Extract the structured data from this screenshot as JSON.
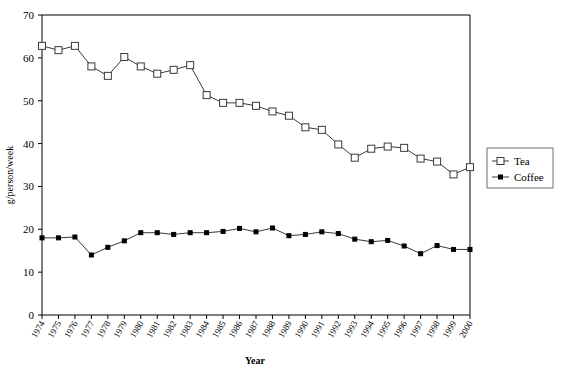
{
  "chart_data": {
    "type": "line",
    "title": "",
    "xlabel": "Year",
    "ylabel": "g/person/week",
    "xlim": [
      1974,
      2000
    ],
    "ylim": [
      0,
      70
    ],
    "ytick_step": 10,
    "yticks": [
      0,
      10,
      20,
      30,
      40,
      50,
      60,
      70
    ],
    "grid": false,
    "legend_position": "right",
    "categories": [
      "1974",
      "1975",
      "1976",
      "1977",
      "1978",
      "1979",
      "1980",
      "1981",
      "1982",
      "1983",
      "1984",
      "1985",
      "1986",
      "1987",
      "1988",
      "1989",
      "1990",
      "1991",
      "1992",
      "1993",
      "1994",
      "1995",
      "1996",
      "1997",
      "1998",
      "1999",
      "2000"
    ],
    "series": [
      {
        "name": "Tea",
        "marker": "open-square",
        "values": [
          62.8,
          61.8,
          62.8,
          58.0,
          55.8,
          60.2,
          58.0,
          56.3,
          57.2,
          58.3,
          51.3,
          49.5,
          49.5,
          48.8,
          47.5,
          46.5,
          43.8,
          43.2,
          39.8,
          36.7,
          38.8,
          39.3,
          39.0,
          36.5,
          35.8,
          32.8,
          34.5
        ]
      },
      {
        "name": "Coffee",
        "marker": "filled-square",
        "values": [
          18.0,
          18.0,
          18.2,
          14.0,
          15.8,
          17.3,
          19.2,
          19.2,
          18.8,
          19.2,
          19.2,
          19.5,
          20.2,
          19.4,
          20.3,
          18.5,
          18.8,
          19.4,
          19.0,
          17.7,
          17.1,
          17.4,
          16.1,
          14.3,
          16.2,
          15.3,
          15.3
        ]
      }
    ]
  },
  "legend": {
    "items": [
      {
        "label": "Tea",
        "marker": "open-square"
      },
      {
        "label": "Coffee",
        "marker": "filled-square"
      }
    ]
  },
  "axes": {
    "x_title": "Year",
    "y_title": "g/person/week"
  }
}
